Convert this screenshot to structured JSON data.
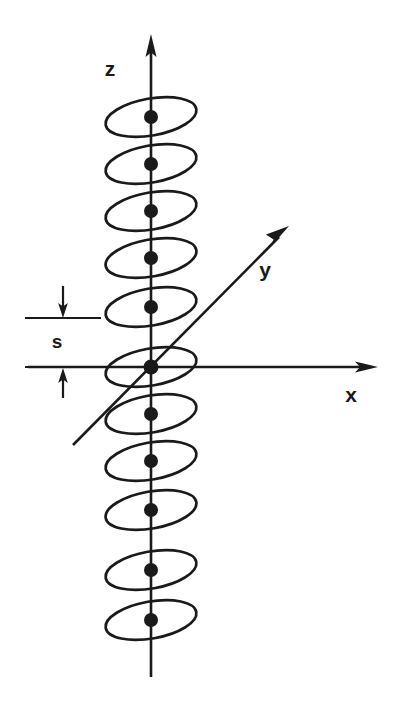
{
  "figure": {
    "background_color": "#ffffff",
    "ink_color": "#1a1a1a",
    "width": 409,
    "height": 706
  },
  "axes": [
    {
      "name": "z",
      "label": "z",
      "label_x": 110,
      "label_y": 70,
      "orientation": "vertical",
      "x1": 151,
      "y1": 677,
      "x2": 151,
      "y2": 44,
      "arrow_at": "top",
      "arrow_tip_x": 151,
      "arrow_tip_y": 36
    },
    {
      "name": "x",
      "label": "x",
      "label_x": 351,
      "label_y": 396,
      "orientation": "horizontal",
      "x1": 28,
      "y1": 367,
      "x2": 366,
      "y2": 367,
      "arrow_at": "right",
      "arrow_tip_x": 376,
      "arrow_tip_y": 367
    },
    {
      "name": "y",
      "label": "y",
      "label_x": 265,
      "label_y": 271,
      "orientation": "oblique",
      "x1": 73,
      "y1": 445,
      "x2": 281,
      "y2": 235,
      "arrow_at": "upper-right",
      "arrow_tip_x": 289,
      "arrow_tip_y": 227
    }
  ],
  "origin": {
    "x": 151,
    "y": 367,
    "dot_radius": 7.5
  },
  "planes": {
    "count": 11,
    "ellipse_rx": 46,
    "ellipse_ry": 18.5,
    "tilt_degrees": -10,
    "spacing_px": 47,
    "dot_radius": 7,
    "centers_y": [
      117,
      164,
      211,
      258,
      305,
      367,
      414,
      461,
      508,
      573,
      620
    ],
    "center_x": 151
  },
  "dimension": {
    "label": "s",
    "label_x": 57,
    "label_y": 343,
    "description": "inter-plane spacing",
    "top_tick": {
      "x1": 25,
      "x2": 101,
      "y": 318
    },
    "bottom_tick": {
      "x1": 25,
      "x2": 101,
      "y": 367
    },
    "upper_arrow": {
      "x": 63,
      "y_tail": 286,
      "y_tip": 317,
      "direction": "down"
    },
    "lower_arrow": {
      "x": 63,
      "y_tail": 398,
      "y_tip": 368,
      "direction": "up"
    }
  }
}
